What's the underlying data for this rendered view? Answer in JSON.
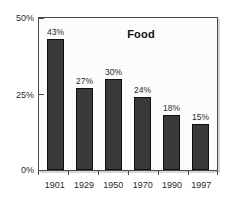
{
  "chart_data": {
    "type": "bar",
    "title": "Food",
    "xlabel": "",
    "ylabel": "",
    "categories": [
      "1901",
      "1929",
      "1950",
      "1970",
      "1990",
      "1997"
    ],
    "values": [
      43,
      27,
      30,
      24,
      18,
      15
    ],
    "value_labels": [
      "43%",
      "27%",
      "30%",
      "24%",
      "18%",
      "15%"
    ],
    "ylim": [
      0,
      50
    ],
    "ytick_values": [
      50,
      25,
      0
    ],
    "ytick_labels": [
      "50%",
      "25%",
      "0%"
    ],
    "grid": false,
    "legend": null,
    "colors": {
      "bar_fill": "#3a3a3a",
      "bar_outline": "#0e0e0e",
      "plot_background": "#fcfcfc",
      "frame": "#4a4a4a",
      "text": "#2a2a2a",
      "title": "#111111",
      "page_background": "#ffffff"
    }
  }
}
